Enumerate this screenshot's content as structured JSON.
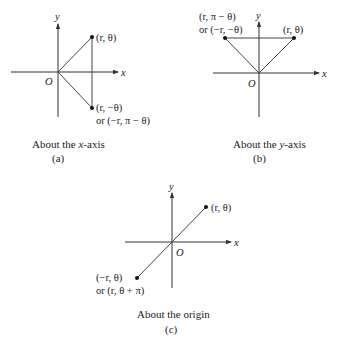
{
  "panels": [
    {
      "id": "a",
      "caption": "About the x-axis",
      "caption_prefix": "About the ",
      "caption_var": "x",
      "caption_suffix": "-axis",
      "sublabel": "(a)",
      "axis_labels": {
        "x": "x",
        "y": "y",
        "origin": "O"
      },
      "points": [
        {
          "label": "(r, θ)"
        },
        {
          "label": "(r, −θ)",
          "alt_label": "or (−r, π − θ)"
        }
      ]
    },
    {
      "id": "b",
      "caption": "About the y-axis",
      "caption_prefix": "About the ",
      "caption_var": "y",
      "caption_suffix": "-axis",
      "sublabel": "(b)",
      "axis_labels": {
        "x": "x",
        "y": "y",
        "origin": "O"
      },
      "points": [
        {
          "label": "(r, θ)"
        },
        {
          "label": "(r, π − θ)",
          "alt_label": "or (−r, −θ)"
        }
      ]
    },
    {
      "id": "c",
      "caption": "About the origin",
      "sublabel": "(c)",
      "axis_labels": {
        "x": "x",
        "y": "y",
        "origin": "O"
      },
      "points": [
        {
          "label": "(r, θ)"
        },
        {
          "label": "(−r, θ)",
          "alt_label": "or (r, θ + π)"
        }
      ]
    }
  ]
}
